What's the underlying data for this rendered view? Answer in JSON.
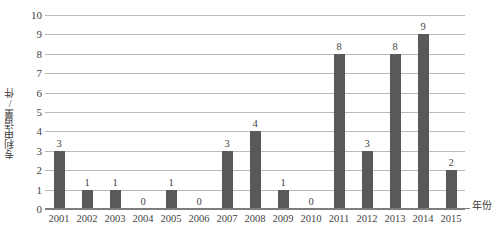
{
  "chart_data": {
    "type": "bar",
    "title": "",
    "xlabel": "年份",
    "ylabel": "专利申请量/件",
    "categories": [
      "2001",
      "2002",
      "2003",
      "2004",
      "2005",
      "2006",
      "2007",
      "2008",
      "2009",
      "2010",
      "2011",
      "2012",
      "2013",
      "2014",
      "2015"
    ],
    "values": [
      3,
      1,
      1,
      0,
      1,
      0,
      3,
      4,
      1,
      0,
      8,
      3,
      8,
      9,
      2
    ],
    "value_labels": [
      "3",
      "1",
      "1",
      "0",
      "1",
      "0",
      "3",
      "4",
      "1",
      "0",
      "8",
      "3",
      "8",
      "9",
      "2"
    ],
    "ylim": [
      0,
      10
    ],
    "ytick_labels": [
      "0",
      "1",
      "2",
      "3",
      "4",
      "5",
      "6",
      "7",
      "8",
      "9",
      "10"
    ],
    "ytick_values": [
      0,
      1,
      2,
      3,
      4,
      5,
      6,
      7,
      8,
      9,
      10
    ],
    "grid": true,
    "legend": false,
    "legend_position": "none",
    "series_name": "专利申请量",
    "bar_color": "#595959",
    "gridline_color": "#b9b9b9",
    "axis_color": "#7d7d7d",
    "text_color": "#3f3f3f",
    "background": "#ffffff"
  }
}
